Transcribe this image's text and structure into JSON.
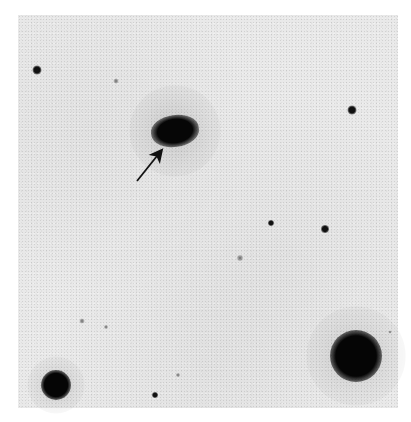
{
  "figure": {
    "top_cutoff_text": "",
    "field_bounds": {
      "left": 18,
      "top": 15,
      "right": 398,
      "bottom": 408
    },
    "colors": {
      "background": "#e9e9e9",
      "objects": "#0a0a0a",
      "paper": "#ffffff"
    },
    "objects": [
      {
        "type": "galaxy",
        "label": "target",
        "x": 175,
        "y": 131,
        "w": 48,
        "h": 32
      },
      {
        "type": "star-bright",
        "x": 356,
        "y": 356,
        "d": 52
      },
      {
        "type": "star-bright",
        "x": 56,
        "y": 385,
        "d": 30
      },
      {
        "type": "star-small",
        "x": 37,
        "y": 70,
        "d": 9
      },
      {
        "type": "star-small",
        "x": 352,
        "y": 110,
        "d": 9
      },
      {
        "type": "star-small",
        "x": 325,
        "y": 229,
        "d": 8
      },
      {
        "type": "star-small",
        "x": 271,
        "y": 223,
        "d": 6
      },
      {
        "type": "star-small",
        "x": 155,
        "y": 395,
        "d": 6
      },
      {
        "type": "star-faint",
        "x": 116,
        "y": 81,
        "d": 5
      },
      {
        "type": "star-faint",
        "x": 82,
        "y": 321,
        "d": 5
      },
      {
        "type": "star-faint",
        "x": 240,
        "y": 258,
        "d": 6
      },
      {
        "type": "star-faint",
        "x": 106,
        "y": 327,
        "d": 4
      },
      {
        "type": "star-faint",
        "x": 178,
        "y": 375,
        "d": 4
      },
      {
        "type": "star-faint",
        "x": 390,
        "y": 332,
        "d": 3
      }
    ],
    "annotation": {
      "type": "arrow",
      "from": {
        "x": 137,
        "y": 181
      },
      "to": {
        "x": 161,
        "y": 151
      },
      "points_to": "galaxy"
    }
  }
}
